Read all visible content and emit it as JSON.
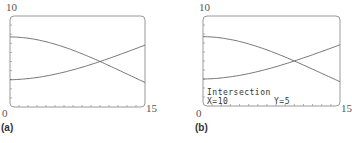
{
  "chart_data": [
    {
      "type": "line",
      "panel": "(a)",
      "xlim": [
        0,
        15
      ],
      "ylim": [
        0,
        10
      ],
      "tick_labels": {
        "y_max": "10",
        "origin": "0",
        "x_max": "15"
      },
      "grid": false,
      "series": [
        {
          "name": "decreasing curve",
          "x": [
            0,
            5,
            10,
            15
          ],
          "y": [
            7.7,
            6.9,
            5.0,
            2.7
          ]
        },
        {
          "name": "increasing curve",
          "x": [
            0,
            5,
            10,
            15
          ],
          "y": [
            3.0,
            3.6,
            5.0,
            6.8
          ]
        }
      ]
    },
    {
      "type": "line",
      "panel": "(b)",
      "xlim": [
        0,
        15
      ],
      "ylim": [
        0,
        10
      ],
      "tick_labels": {
        "y_max": "10",
        "origin": "0",
        "x_max": "15"
      },
      "grid": false,
      "series": [
        {
          "name": "decreasing curve",
          "x": [
            0,
            5,
            10,
            15
          ],
          "y": [
            7.7,
            6.9,
            5.0,
            2.7
          ]
        },
        {
          "name": "increasing curve",
          "x": [
            0,
            5,
            10,
            15
          ],
          "y": [
            3.0,
            3.6,
            5.0,
            6.8
          ]
        }
      ],
      "annotations": [
        "Intersection",
        "X=10",
        "Y=5"
      ]
    }
  ],
  "panels": [
    {
      "caption": "(a)",
      "y_max": "10",
      "origin": "0",
      "x_max": "15"
    },
    {
      "caption": "(b)",
      "y_max": "10",
      "origin": "0",
      "x_max": "15",
      "calc": {
        "title": "Intersection",
        "x_text": "X=10",
        "y_text": "Y=5"
      }
    }
  ]
}
